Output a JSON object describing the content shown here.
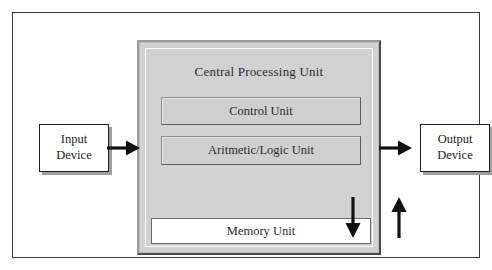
{
  "diagram": {
    "cpu": {
      "label": "Central Processing Unit",
      "units": [
        {
          "id": "control-unit",
          "label": "Control Unit",
          "fill": "#cfcfcf"
        },
        {
          "id": "alu-unit",
          "label": "Aritmetic/Logic Unit",
          "fill": "#cfcfcf"
        },
        {
          "id": "memory-unit",
          "label": "Memory Unit",
          "fill": "#ffffff"
        }
      ],
      "fill": "#d2d2d2"
    },
    "devices": [
      {
        "id": "input-device",
        "line1": "Input",
        "line2": "Device",
        "fill": "#ffffff"
      },
      {
        "id": "output-device",
        "line1": "Output",
        "line2": "Device",
        "fill": "#ffffff"
      }
    ],
    "arrows": [
      {
        "id": "input-to-cpu-arrow",
        "direction": "right",
        "from": "Input Device",
        "to": "Central Processing Unit"
      },
      {
        "id": "cpu-to-output-arrow",
        "direction": "right",
        "from": "Central Processing Unit",
        "to": "Output Device"
      },
      {
        "id": "cpu-to-memory-arrow",
        "direction": "down",
        "from": "Aritmetic/Logic Unit",
        "to": "Memory Unit"
      },
      {
        "id": "memory-to-cpu-arrow",
        "direction": "up",
        "from": "Memory Unit",
        "to": "Aritmetic/Logic Unit"
      }
    ],
    "colors": {
      "frame_border": "#3c3c3c",
      "cpu_fill": "#d2d2d2",
      "unit_fill": "#cfcfcf",
      "memory_fill": "#ffffff",
      "device_border": "#1d1d1d",
      "arrow": "#111111",
      "shadow": "#9f9f9f",
      "page_background": "#ffffff"
    }
  }
}
